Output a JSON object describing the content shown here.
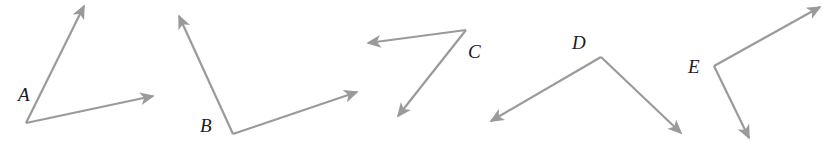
{
  "figure": {
    "background_color": "#ffffff",
    "stroke_color": "#9a9a9a",
    "label_color": "#1b1b1b",
    "stroke_width": 2.2,
    "width": 834,
    "height": 151
  },
  "angles": [
    {
      "id": "A",
      "label": "A",
      "label_x": 18,
      "label_y": 85,
      "vertex": {
        "x": 26,
        "y": 123
      },
      "rays": [
        {
          "name": "ray-a-upper",
          "tip_x": 84,
          "tip_y": 6
        },
        {
          "name": "ray-a-right",
          "tip_x": 153,
          "tip_y": 96
        }
      ]
    },
    {
      "id": "B",
      "label": "B",
      "label_x": 200,
      "label_y": 116,
      "vertex": {
        "x": 233,
        "y": 134
      },
      "rays": [
        {
          "name": "ray-b-upper-left",
          "tip_x": 179,
          "tip_y": 16
        },
        {
          "name": "ray-b-right",
          "tip_x": 357,
          "tip_y": 92
        }
      ]
    },
    {
      "id": "C",
      "label": "C",
      "label_x": 468,
      "label_y": 42,
      "vertex": {
        "x": 466,
        "y": 30
      },
      "rays": [
        {
          "name": "ray-c-left",
          "tip_x": 368,
          "tip_y": 43
        },
        {
          "name": "ray-c-lower-left",
          "tip_x": 398,
          "tip_y": 116
        }
      ]
    },
    {
      "id": "D",
      "label": "D",
      "label_x": 572,
      "label_y": 33,
      "vertex": {
        "x": 601,
        "y": 57
      },
      "rays": [
        {
          "name": "ray-d-lower-left",
          "tip_x": 491,
          "tip_y": 121
        },
        {
          "name": "ray-d-lower-right",
          "tip_x": 681,
          "tip_y": 133
        }
      ]
    },
    {
      "id": "E",
      "label": "E",
      "label_x": 688,
      "label_y": 57,
      "vertex": {
        "x": 714,
        "y": 66
      },
      "rays": [
        {
          "name": "ray-e-upper-right",
          "tip_x": 820,
          "tip_y": 7
        },
        {
          "name": "ray-e-lower",
          "tip_x": 749,
          "tip_y": 138
        }
      ]
    }
  ]
}
